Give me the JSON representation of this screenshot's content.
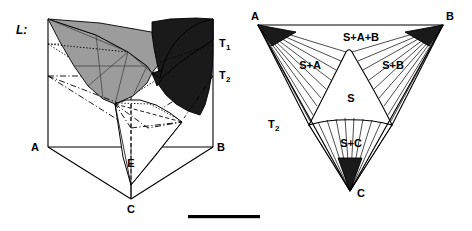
{
  "figure": {
    "panel_label": "L:",
    "scale_bar": {
      "name": "scale-bar"
    }
  },
  "left_diagram": {
    "name": "3d-phase-prism",
    "vertices": [
      {
        "id": "A",
        "label": "A"
      },
      {
        "id": "B",
        "label": "B"
      },
      {
        "id": "C",
        "label": "C"
      },
      {
        "id": "E",
        "label": "E"
      }
    ],
    "isotherms": [
      {
        "id": "T1",
        "label": "T",
        "sub": "1"
      },
      {
        "id": "T2",
        "label": "T",
        "sub": "2"
      }
    ]
  },
  "right_diagram": {
    "name": "ternary-projection-triangle",
    "vertices": [
      {
        "id": "A",
        "label": "A"
      },
      {
        "id": "B",
        "label": "B"
      },
      {
        "id": "C",
        "label": "C"
      }
    ],
    "fields": [
      {
        "id": "S-A-B",
        "label": "S+A+B"
      },
      {
        "id": "S-A",
        "label": "S+A"
      },
      {
        "id": "S-B",
        "label": "S+B"
      },
      {
        "id": "S",
        "label": "S"
      },
      {
        "id": "S-C",
        "label": "S+C"
      }
    ],
    "isotherms": [
      {
        "id": "T2",
        "label": "T",
        "sub": "2"
      }
    ]
  },
  "colors": {
    "ink": "#000000",
    "surface_light": "#9c9c9c",
    "surface_dark": "#1a1a1a",
    "paper": "#ffffff"
  }
}
